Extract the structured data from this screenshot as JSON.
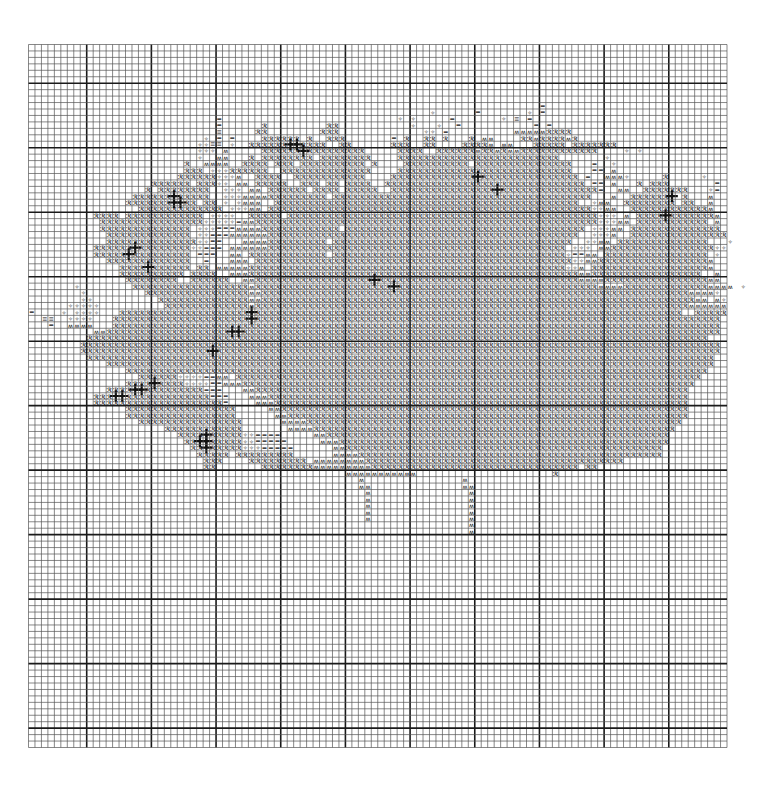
{
  "pattern": {
    "title": "Cross-stitch chart",
    "grid": {
      "columns": 108,
      "rows": 109,
      "major_every": 10,
      "major_col_offset": 9,
      "major_row_offset": 6
    },
    "colors": {
      "background": "#ffffff",
      "grid_minor": "#555555",
      "grid_major": "#1a1a1a",
      "symbol": "#111111",
      "shade": "#9a9a9a"
    },
    "legend": [
      {
        "key": "R",
        "glyph": "ℛ",
        "name": "dark-petal-symbol"
      },
      {
        "key": "M",
        "glyph": "ʍ",
        "name": "stem-symbol"
      },
      {
        "key": "S",
        "glyph": "✧",
        "name": "star-symbol"
      },
      {
        "key": "E",
        "glyph": "=",
        "name": "equal-symbol"
      },
      {
        "key": "G",
        "glyph": "≡",
        "name": "shaded-equal-symbol"
      },
      {
        "key": "O",
        "glyph": "ȯ",
        "name": "dot-stem-symbol"
      },
      {
        "key": "X",
        "glyph": "✚",
        "name": "backstitch-cross-symbol"
      }
    ],
    "rows": [
      "",
      "",
      "",
      "",
      "",
      "",
      "",
      "",
      "..........................................................................",
      "...............................................................................E",
      "..............................................................S......E.......S.E",
      ".............................E...........................S.S.....E.......S.G.E",
      ".............................E......R.........RR...........S...S..E...........E.E",
      ".............................G.....RR........RRR.............SS.E..........MMMMMRRRR",
      "...........................S.E.E....RRRRRR.R..RRR.......E.R..RR.R...R.MM....RRMRRRRMR",
      "..........................SSGG.S..RRRRRRXXRRRR..RR......RRR..RR....RRRRM.MM...RRRRR.RRRRRRR",
      "..........................SSS.M.....RRRRRRXRRRRRRRRR.....RRRR..RRRRRRMRRMRMMRRRRRRRRRRRR....S.S",
      "..........................S..MM...R.RRRRRRRR.RRRRRRRR....RRRRRRRRRRRRRRRRRRRRRRRRR.......S",
      "........................R..MMMM..RRRR.RRR.RRRRRRRRRR.R....RRRRRRRRRR.RRRRRRRRRRRRRRR...E..S",
      "........................RRR.SSSRRRRRR..RRRRRRRRRRRRRR....RRRRRRRRRRRRRRRRRRRRRRRRRRR...EE.M",
      ".......................RRRRRRSSSM..RRRR..RRRRRRRRRRR....RRRRRRRRRRRRRXRRRRRRRRRRRRRRR.E..MMMS.....R.....S",
      "...................RRRRRR.RRRSS.MM.RRRRR..RRR.RR.RRRR..RRRRRRRRRRRRRRRRRRRRRRRRRRRRRRR.EE.M...R.RRR.......E",
      "..................R.RRRRRRRR..SSS.MM.RRRRRR.RRRR.RRRRR..RRRRRRRRRRRRRRRRXRRRRRRRRRRRRRRRE..MM..RRRRRRR...SE",
      "................RRRRRRXRRRRR..SSSMMMMRRRRRRRRR.RRRRRRRRRRRRRRRRRRRRRRRRRRRRRRRRRRRRRRRR...M..RRRRRRX.R...M",
      "...............RRRRRRRXXRR.RR.S.SMMM..RRRRRRRRRRRRRRRRRRRRRRRRRRRRRRRRRRRRRRRRRRRRRRR..SMM..RRRRRRRR.RR..M",
      ".................RRRRRRRRRRRRR.SSSMM.RRRRRRRRRRRRRRRRRRRRRRRRRRRRRRRRRRRRRRRRRRRRRRRRRRSSMM..RRRRRRRRRRRRM",
      "..........RRRR.RRRRRRRRRRRR.SSSS..RRRRR.RRRRRRRRRRRRRRRRRRRRRRRRRRRRRRRRRRRRRRRRRRRRRRRRSSS.M.RRRRXRRRRRRRM",
      "...........RRRRRRRRRRRRRRRRSSSSSEMMRRRRRRRRRRRRRRRRRRRRRRRRRRRRRRRRRRRRRRRRRRRRRRRRRRRRRSSSMM.RRRRRRRRRRR.M",
      "...........RRRRRRRRRRRRRR.SSSEEEMMMMRRRRRRRRRRRR.RRRRRRRRRRRRRRRRRRRRRRRRRRRRRRRRRRRRR.SSSMM.RRRRRRRRRRRRRR",
      "............RRRRRRRRRRRRR.SSEEEMMMMMMRRRRRRRRRRRRRRRRRRRRRRRRRRRRRRRRRRRRRRRRRRRRRRRR..SSSM..RRRRRRRRRRRRRRR",
      "............RRRRRRRRRRRRRRSSEE...MMMMRRRRRRRRR.RRRRRRRRRRRRRRRRRRRRRRRRRRRRRRRRRRRRR..SSMM.RRRRRRRRRRRRRR...S",
      "..........RRRRRRXRRRRRRRRSSEEE.MMMMMMRRRRRRRRRRRRRRRRRRRRRRRRRRRRRRRRRRRRRRRRRRRRRR.SSS.MMRRRRRRRRRRRRRRRRSS",
      "..........RRRRRXRRRRRRRRR.EEE..MM.RRRRRRRRRRRR.RRRRRRRRRRRRRRRRRRRRRRRRRRRRRRRRRRRRSEEMM.RRRRRRRRRRRRRRRR.S",
      "............RRRRRRRRRRRRR..E...MMM.RRRRRRRRRRRRRRRRRRRRRRRRRRRRRRRRRRRRRRRRRRRRRRRRRSSMMRRRRRRRRRRRRRRRRRM",
      "..............RRRRXRRRRRR.RR.MMMMMRRRRRRRRRRRRRRRRRRRRRRRRRRRRRRRRRRRRRRRRRRRRRRRRRSSM.RRRRRRRRRRRRRRRRRRM",
      "..............RRRRRRRRRR.RRRR..MMMRRRRRRRRRRRRRRRRRRRRRRRRRRRRRRRRRRRRRRRRRRRRRRRRRRRMMRRRRRRRRRRRRRRRRR..M",
      "...............RRRRRRRR..RRRRRR..MMRRRRRRRRRRRRRRRRRRXRRRRRRRRRRRRRRRRRRRRRRRRRRRRRRRMMMMRRRRRRRRRRRRRRRRMM",
      ".......S........RRRRRRRRRRRRRRRRRRMRRRRRRRRRRRRRRRRRRRRRXRRRRRRRRRRRRRRRRRRRRRRRRRRRRRRRMMMMRRRRRRRRRRRRRMMMM.S",
      "........S.........RRRRRRRRRRRRRRRRMMRRRRRRRRRRRRRRRRRRRRRRRRRRRRRRRRRRRRRRRRRRRRRRRRRRRRRRRRRRRRRRRRRRMMMMS",
      "........SS..........RRRRRRRRRRRRRRMMRRRRRRRRRRRRRRRRRRRRRRRRRRRRRRRRRRRRRRRRRRRRRRRRRRRRRRRRRRRRRRRRRRRMM.MS",
      "......SSSSS..........RRRRRRRRRRRRRMRRRRRRRRRRRRRRRRRRRRRRRRRRRRRRRRRRRRRRRRRRRRRRRRRRRRRRRRRRRRRRRRRRRMMMMMM",
      "E....S.SSSS...RRRRRRRRRRRRRRRRRRRRXRRRRRRRRRRRRRRRRRRRRRRRRRRRRRRRRRRRRRRRRRRRRRRRRRRRRRRRRRRRRRRRRRR..RRRRR",
      "..GG..SSSS...RRRRRRRRRRRRRRRRRRRRRXRRRRRRRRRRRRRRRRRRRRRRRRRRRRRRRRRRRRRRRRRRRRRRRRRRRRRRRRRRRRRRRRRRRRRRRR",
      "...E..MMMM...RRRRRRRRRRRRRRRRRRRRRRRRRRRRRRRRRRRRRRRRRRRRRRRRRRRRRRRRRRRRRRRRRRRRRRRRRRRRRRRRRRRRRRRRRRRRRR",
      "..........MMRRRRRRRRRRRRRRRRRRRXXRRRRRRRRRRRRRRRRRRRRRRRRRRRRRRRRRRRRRRRRRRRRRRRRRRRRRRRRRRRRRRRRRRRRRRRRRR",
      ".........RRRRRRRRRRRRRRRRRRRRRRRRRRRRRRRRRRRRRRRRRRRRRRRRRRRRRRRRRRRRRRRRRRRRRRRRRRRRRRRRRRRRRRRRRRRRRRRR",
      "........RRRRRRRRRRRRRRRRRRRRRRRRRRRRRRRRRRRRRRRRRRRRRRRRRRRRRRRRRRRRRRRRRRRRRRRRRRRRRRRRRRRRRRRRRRRRRRRRRRR",
      "........RRRRRRRRRRRRRRRRRRRRXRRRRRRRRRRRRRRRRRRRRRRRRRRRRRRRRRRRRRRRRRRRRRRRRRRRRRRRRRRRRRRRRRRRRRRRRRRRRRR",
      ".........RRRRRRRRRRRRRRRRRRRRRRRRRRRRRRRRRRRRRRRRRRRRRRRRRRRRRRRRRRRRRRRRRRRRRRRRRRRRRRRRRRRRRRRRRRRRRRRRR",
      "............RRRRRRRRRRRRRRRRRRRRRRRRRRRRRRRRRRRRRRRRRRRRRRRRRRRRRRRRRRRRRRRRRRRRRRRRRRRRRRRRRRRRRRRRRRRRRR",
      "...............RRRRRRRRRRRRRRRRRRRRRRRRRRRRRRRRRRRRRRRRRRRRRRRRRRRRRRRRRRRRRRRRRRRRRRRRRRRRRRRRRRRRRRRRRR",
      ".................RRRRRRSSSSEEMM.RRRRRRRRRRRRRRRRRRRRRRRRRRRRRRRRRRRRRRRRRRRRRRRRRRRRRRRRRRRRRRRRRRRRRRRR",
      "...............RRRRXRRRRSSSSEEMMMRRRRRRRRRRRRRRRRRRRRRRRRRRRRRRRRRRRRRRRRRRRRRRRRRRRRRRRRRRRRRRRRRRRRRR",
      "............RRRRXXRRRRRRRRREEE...MMRRRRRRRRRRRRRRRRRRRRRRRRRRRRRRRRRRRRRRRRRRRRRRRRRRRRRRRRRRRRRRRRRRR",
      "..........RRRXXRRRRRRRRRRRRREEE...MMMRRRRRRRRRRRRRRRRRRRRRRRRRRRRRRRRRRRRRRRRRRRRRRRRRRRRRRRRRRRRRRRRR",
      "..........RRRRRRRRRRRRRRRRRRRRE....MMMRRRRRRRRRRRRRRRRRRRRRRRRRRRRRRRRRRRRRRRRRRRRRRRRRRRRRRRRRRRRRRRR",
      "...............RRRRRRRRRRRRRRRRR.....MMRRRRRRRRRRRRRRRRRRRRRRRRRRRRRRRRRRRRRRRRRRRRRRRRRRRRRRRRRRRRRRR",
      "...............RRRRRRRRRRRRRRRRR......MMRRRRRRRRRRRRRRRRRRRRRRRRRRRRRRRRRRRRRRRRRRRRRRRRRRRRRRRRRRRRRR",
      ".................RRRRRRRRRRRRRRRR......MMMMRRRRRRRRRRRRRRRRRRRRRRRRRRRRRRRRRRRRRRRRRRRRRRRRRRRRRRRRRR",
      ".....................RRRRRRRRRRRR.......MMMMRRRRRRRRRRRRRRRRRRRRRRRRRRRRRRRRRRRRRRRRRRRRRRRRRRRRRRRR",
      ".......................RRRRXRRRRRSSEEEE.....MMRRRRRRRRRRRRRRRRRRRRRRRRRRRRRRRRRRRRRRRRRRRRRRRRRRRRR",
      "........................RRXXRRRRRSSEEEEE.....MMMRRRRRRRRRRRRRRRRRRRRRRRRRRRRRRRRRRRRRRRRRRRRRRRRRRR",
      ".........................RRXRRRRRSSSEEEEE......MMRRRRRRRRRRRRRRRRRRRRRRRRRRRRRRRRRRRRRRRRRRRRRRRRR",
      "..........................RRRRR.RRRRRRRRR......MMMMRRRRRRRRRRRRRRRRRRRRRRRRRRRRRRRRRRRRRRRRRRRRRRR",
      "...........................RRR....RRRRRRRRR.MMMMMMMMRRRRRRRRRRRRRRRRRRRRRRRRRRRRRRRRRRRRRRRR",
      "...........................RR.......RRRRRRRRMMMMMMMMMRRRRRRRRRRRRRRRRRRRRRRRRRRRRRRRR.RR",
      ".................................................MMMMMMMMMMM.....................R",
      "...................................................M...............M",
      "...................................................MM..............MM",
      "....................................................M...............M",
      "....................................................M...............M",
      "....................................................M...............M",
      "....................................................M...............M",
      "....................................................M...............M",
      "....................................................................M",
      "....................................................................M"
    ]
  }
}
